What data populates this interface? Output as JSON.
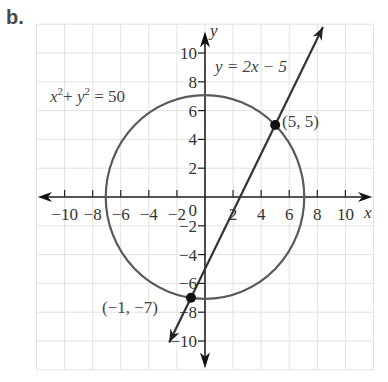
{
  "panel_label": "b.",
  "chart_data": {
    "type": "line",
    "title": "",
    "xlabel": "x",
    "ylabel": "y",
    "xlim": [
      -12,
      12
    ],
    "ylim": [
      -12,
      12
    ],
    "grid": true,
    "x_ticks": [
      "-10",
      "-8",
      "-6",
      "-4",
      "-2",
      "2",
      "4",
      "6",
      "8",
      "10"
    ],
    "y_ticks": [
      "10",
      "8",
      "6",
      "4",
      "2",
      "-2",
      "-4",
      "-6",
      "-8",
      "-10"
    ],
    "origin_label": "0",
    "series": [
      {
        "name": "circle",
        "equation": "x² + y² = 50",
        "type": "circle",
        "center": [
          0,
          0
        ],
        "radius": 7.07
      },
      {
        "name": "line",
        "equation": "y = 2x − 5",
        "type": "line",
        "slope": 2,
        "intercept": -5
      }
    ],
    "annotations": [
      {
        "label": "(5, 5)",
        "x": 5,
        "y": 5
      },
      {
        "label": "(−1, −7)",
        "x": -1,
        "y": -7
      }
    ]
  },
  "labels": {
    "circle_eq_x": "x",
    "circle_eq_mid": "+ ",
    "circle_eq_y": "y",
    "circle_eq_end": " = 50",
    "line_eq": "y = 2x − 5",
    "point1": "(5, 5)",
    "point2": "(−1, −7)",
    "x_axis": "x",
    "y_axis": "y",
    "origin": "0",
    "sup2": "2"
  }
}
